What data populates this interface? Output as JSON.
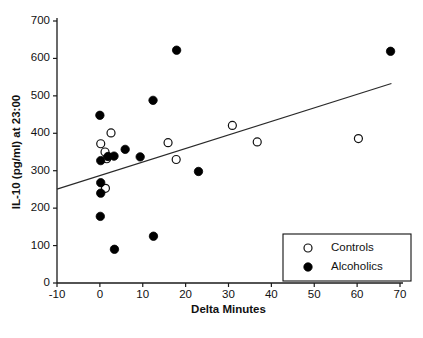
{
  "chart_data": {
    "type": "scatter",
    "title": "",
    "xlabel": "Delta Minutes",
    "ylabel": "IL-10 (pg/ml) at 23:00",
    "xlim": [
      -10,
      70
    ],
    "ylim": [
      0,
      700
    ],
    "xticks": [
      -10,
      0,
      10,
      20,
      30,
      40,
      50,
      60,
      70
    ],
    "xtick_labels": [
      "-10",
      "0",
      "10",
      "20",
      "30",
      "40",
      "50",
      "60",
      "70"
    ],
    "yticks": [
      0,
      100,
      200,
      300,
      400,
      500,
      600,
      700
    ],
    "ytick_labels": [
      "0",
      "100",
      "200",
      "300",
      "400",
      "500",
      "600",
      "700"
    ],
    "grid": false,
    "legend_position": "lower-right",
    "series": [
      {
        "name": "Controls",
        "marker": "open-circle",
        "color": "#ffffff",
        "edge_color": "#111111",
        "points": [
          {
            "x": 0.2,
            "y": 372
          },
          {
            "x": 1.2,
            "y": 350
          },
          {
            "x": 1.6,
            "y": 332
          },
          {
            "x": 2.6,
            "y": 401
          },
          {
            "x": 1.3,
            "y": 253
          },
          {
            "x": 15.9,
            "y": 375
          },
          {
            "x": 17.8,
            "y": 330
          },
          {
            "x": 30.9,
            "y": 421
          },
          {
            "x": 36.7,
            "y": 377
          },
          {
            "x": 60.3,
            "y": 386
          }
        ]
      },
      {
        "name": "Alcoholics",
        "marker": "filled-circle",
        "color": "#000000",
        "edge_color": "#000000",
        "points": [
          {
            "x": 0.0,
            "y": 448
          },
          {
            "x": 0.2,
            "y": 327
          },
          {
            "x": 1.9,
            "y": 338
          },
          {
            "x": 3.3,
            "y": 339
          },
          {
            "x": 0.2,
            "y": 268
          },
          {
            "x": 0.2,
            "y": 240
          },
          {
            "x": 0.1,
            "y": 178
          },
          {
            "x": 3.4,
            "y": 90
          },
          {
            "x": 5.9,
            "y": 357
          },
          {
            "x": 9.4,
            "y": 337
          },
          {
            "x": 12.4,
            "y": 488
          },
          {
            "x": 12.5,
            "y": 125
          },
          {
            "x": 17.9,
            "y": 622
          },
          {
            "x": 23.0,
            "y": 298
          },
          {
            "x": 67.8,
            "y": 619
          }
        ]
      }
    ],
    "trendline": {
      "name": "regression-line",
      "x_start": -10,
      "y_start": 251,
      "x_end": 68,
      "y_end": 533,
      "color": "#2a2a2a"
    }
  },
  "legend": {
    "entries": [
      {
        "label": "Controls",
        "marker": "open-circle"
      },
      {
        "label": "Alcoholics",
        "marker": "filled-circle"
      }
    ]
  }
}
